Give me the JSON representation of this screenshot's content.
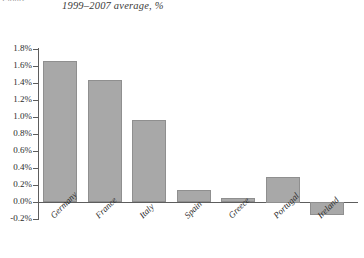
{
  "figure": {
    "caption_remnant": "Figure",
    "subtitle": "1999–2007 average, %"
  },
  "style": {
    "bar_fill": "#a8a8a8",
    "bar_border": "#8f8f8f",
    "axis_color": "#5d5d5d",
    "background": "#ffffff",
    "text_color": "#2b2b2b"
  },
  "chart_data": {
    "type": "bar",
    "title": "",
    "subtitle": "1999–2007 average, %",
    "xlabel": "",
    "ylabel": "",
    "ylim": [
      -0.2,
      1.8
    ],
    "ytick_step": 0.2,
    "grid": false,
    "legend": false,
    "ytick_labels": [
      "1.8%",
      "1.6%",
      "1.4%",
      "1.2%",
      "1.0%",
      "0.8%",
      "0.6%",
      "0.4%",
      "0.2%",
      "0.0%",
      "-0.2%"
    ],
    "ytick_values": [
      1.8,
      1.6,
      1.4,
      1.2,
      1.0,
      0.8,
      0.6,
      0.4,
      0.2,
      0.0,
      -0.2
    ],
    "categories": [
      "Germany",
      "France",
      "Italy",
      "Spain",
      "Greece",
      "Portugal",
      "Ireland"
    ],
    "values": [
      1.66,
      1.44,
      0.96,
      0.14,
      0.05,
      0.3,
      -0.15
    ],
    "units": "%"
  }
}
